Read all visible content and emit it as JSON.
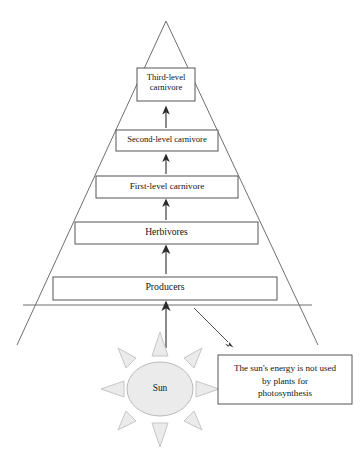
{
  "diagram": {
    "pyramid": {
      "levels": [
        {
          "id": "third-level-carnivore",
          "label": "Third-level\ncarnivore",
          "order": 5
        },
        {
          "id": "second-level-carnivore",
          "label": "Second-level carnivore",
          "order": 4
        },
        {
          "id": "first-level-carnivore",
          "label": "First-level carnivore",
          "order": 3
        },
        {
          "id": "herbivores",
          "label": "Herbivores",
          "order": 2
        },
        {
          "id": "producers",
          "label": "Producers",
          "order": 1
        }
      ]
    },
    "sun": {
      "label": "Sun",
      "ray_count": 8,
      "fill_color": "#ebebeb",
      "stroke_color": "#b9b9b9"
    },
    "note": {
      "text": "The sun's energy is not used\nby plants for\nphotosynthesis"
    },
    "arrows": [
      {
        "id": "sun-to-producers",
        "from": "sun",
        "to": "producers",
        "direction": "up"
      },
      {
        "id": "producers-to-herbivores",
        "from": "producers",
        "to": "herbivores",
        "direction": "up"
      },
      {
        "id": "herbivores-to-first-level-carnivore",
        "from": "herbivores",
        "to": "first-level-carnivore",
        "direction": "up"
      },
      {
        "id": "first-to-second-level-carnivore",
        "from": "first-level-carnivore",
        "to": "second-level-carnivore",
        "direction": "up"
      },
      {
        "id": "second-to-third-level-carnivore",
        "from": "second-level-carnivore",
        "to": "third-level-carnivore",
        "direction": "up"
      },
      {
        "id": "energy-loss-callout",
        "from": "pyramid-base",
        "to": "note",
        "direction": "down-right"
      }
    ],
    "colors": {
      "outline": "#6f6f72",
      "box_stroke": "#55555a",
      "arrow": "#2b2b2b",
      "background": "#ffffff"
    }
  }
}
